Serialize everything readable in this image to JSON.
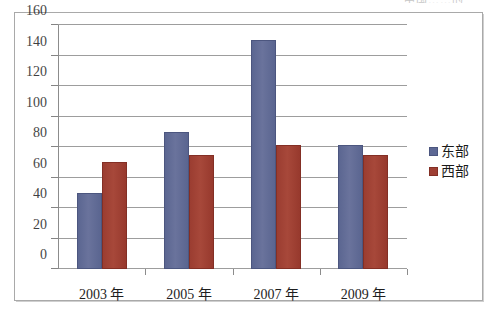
{
  "page": {
    "top_cut_caption": "中国……的",
    "frame_border_color": "#a9a9a9"
  },
  "legend": {
    "position": "right",
    "items": [
      {
        "label": "东部",
        "color": "#5d6894",
        "swatch_name": "legend-swatch-east"
      },
      {
        "label": "西部",
        "color": "#9e3f33",
        "swatch_name": "legend-swatch-west"
      }
    ]
  },
  "axis": {
    "y_ticks": [
      "160",
      "140",
      "120",
      "100",
      "80",
      "60",
      "40",
      "20",
      "0"
    ],
    "x_ticks": [
      "2003 年",
      "2005 年",
      "2007 年",
      "2009 年"
    ]
  },
  "chart_data": {
    "type": "bar",
    "title": "",
    "subtitle": "",
    "xlabel": "",
    "ylabel": "",
    "categories": [
      "2003 年",
      "2005 年",
      "2007 年",
      "2009 年"
    ],
    "series": [
      {
        "name": "东部",
        "color": "#5d6894",
        "values": [
          50,
          90,
          150,
          81
        ]
      },
      {
        "name": "西部",
        "color": "#9e3f33",
        "values": [
          70,
          75,
          81,
          75
        ]
      }
    ],
    "ylim": [
      0,
      160
    ],
    "ytick_step": 20,
    "ytick_values": [
      0,
      20,
      40,
      60,
      80,
      100,
      120,
      140,
      160
    ],
    "grid": true,
    "grid_axis": "y",
    "legend_position": "right",
    "annotations": []
  }
}
